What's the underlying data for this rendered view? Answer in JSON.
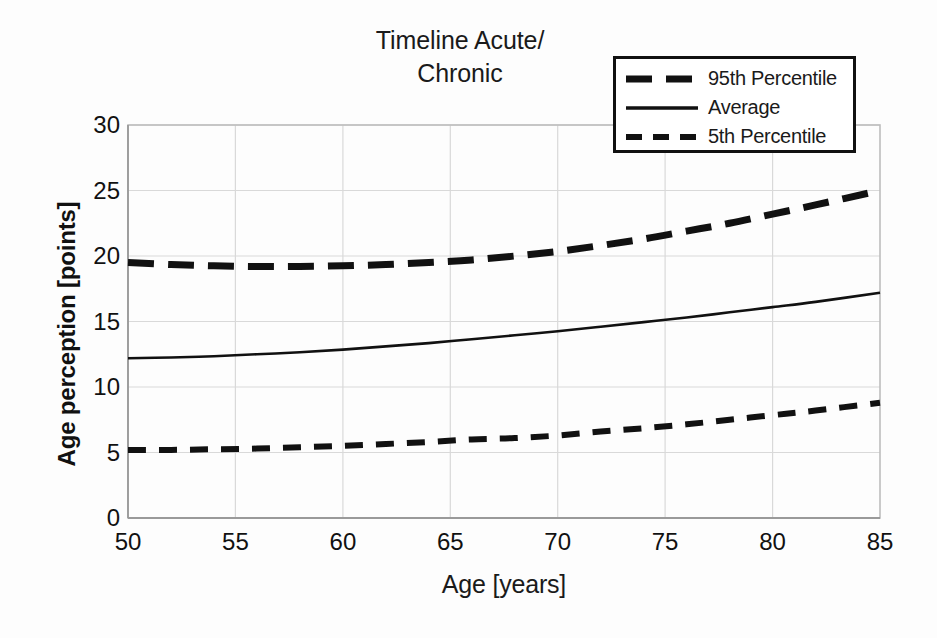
{
  "chart_data": {
    "type": "line",
    "title": "Timeline Acute/\nChronic",
    "xlabel": "Age [years]",
    "ylabel": "Age perception [points]",
    "xlim": [
      50,
      85
    ],
    "ylim": [
      0,
      30
    ],
    "xticks": [
      50,
      55,
      60,
      65,
      70,
      75,
      80,
      85
    ],
    "yticks": [
      0,
      5,
      10,
      15,
      20,
      25,
      30
    ],
    "grid": "horizontal-and-vertical-light",
    "legend_position": "top-right",
    "x": [
      50,
      52,
      54,
      56,
      58,
      60,
      62,
      64,
      66,
      68,
      70,
      72,
      74,
      76,
      78,
      80,
      82,
      85
    ],
    "series": [
      {
        "name": "95th Percentile",
        "style": "dashed-thick",
        "values": [
          19.5,
          19.35,
          19.25,
          19.2,
          19.2,
          19.25,
          19.35,
          19.5,
          19.7,
          20.0,
          20.35,
          20.8,
          21.3,
          21.9,
          22.5,
          23.2,
          23.9,
          25.0
        ]
      },
      {
        "name": "Average",
        "style": "solid-thin",
        "values": [
          12.2,
          12.25,
          12.35,
          12.5,
          12.65,
          12.85,
          13.1,
          13.35,
          13.65,
          13.95,
          14.25,
          14.6,
          14.95,
          15.3,
          15.7,
          16.1,
          16.5,
          17.2
        ]
      },
      {
        "name": "5th Percentile",
        "style": "dashed-medium",
        "values": [
          5.2,
          5.2,
          5.25,
          5.3,
          5.4,
          5.5,
          5.65,
          5.8,
          6.0,
          6.1,
          6.3,
          6.6,
          6.85,
          7.15,
          7.5,
          7.85,
          8.2,
          8.8
        ]
      }
    ]
  },
  "legend": {
    "items": [
      {
        "label": "95th Percentile",
        "swatch": "dashed-thick-swatch"
      },
      {
        "label": "Average",
        "swatch": "solid-line-swatch"
      },
      {
        "label": "5th Percentile",
        "swatch": "dashed-medium-swatch"
      }
    ]
  },
  "axes": {
    "x_title": "Age [years]",
    "y_title": "Age perception [points]",
    "x_tick_labels": [
      "50",
      "55",
      "60",
      "65",
      "70",
      "75",
      "80",
      "85"
    ],
    "y_tick_labels": [
      "0",
      "5",
      "10",
      "15",
      "20",
      "25",
      "30"
    ]
  },
  "title": {
    "line1": "Timeline Acute/",
    "line2": "Chronic",
    "full": "Timeline Acute/\nChronic"
  },
  "colors": {
    "ink": "#111111",
    "grid": "#d9d9d9",
    "frame": "#bdbdbd",
    "background": "#ffffff"
  }
}
